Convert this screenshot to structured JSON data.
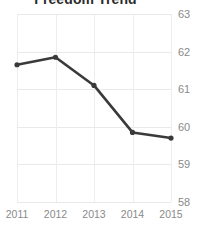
{
  "chart_data": {
    "type": "line",
    "title": "Freedom Trend",
    "xlabel": "",
    "ylabel": "",
    "x": [
      "2011",
      "2012",
      "2013",
      "2014",
      "2015"
    ],
    "categories": [
      "2011",
      "2012",
      "2013",
      "2014",
      "2015"
    ],
    "values": [
      61.65,
      61.85,
      61.1,
      59.85,
      59.7
    ],
    "series": [
      {
        "name": "Freedom",
        "values": [
          61.65,
          61.85,
          61.1,
          59.85,
          59.7
        ]
      }
    ],
    "ylim": [
      58,
      63
    ],
    "yticks": [
      63,
      62,
      61,
      60,
      59,
      58
    ],
    "ytick_labels": [
      "63",
      "62",
      "61",
      "60",
      "59",
      "58"
    ],
    "xtick_labels": [
      "2011",
      "2012",
      "2013",
      "2014",
      "2015"
    ],
    "grid": true,
    "grid_axis": "both",
    "legend": false,
    "legend_position": "none",
    "yaxis_side": "right",
    "marker": "circle",
    "line_color": "#3a3a3a",
    "marker_color": "#3a3a3a",
    "grid_color": "#e9e9e9",
    "tick_label_color": "#8a8a8a",
    "title_color": "#2b2b2b",
    "background": "#ffffff"
  }
}
